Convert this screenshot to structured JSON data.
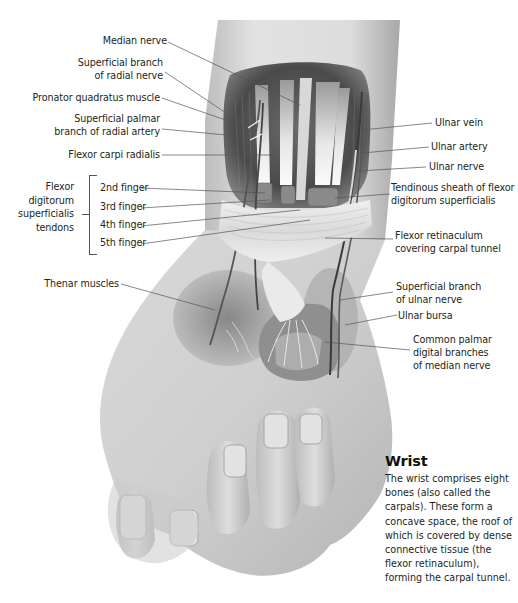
{
  "figure": {
    "palette": {
      "background": "#ffffff",
      "text": "#231f20",
      "leader_line": "#555555",
      "skin_light": "#e6e6e6",
      "skin_mid": "#c9c9c9",
      "skin_dark": "#8c8c8c",
      "muscle_dark": "#5a5a5a",
      "tendon_highlight": "#f4f4f4"
    }
  },
  "labels_left": [
    {
      "id": "median-nerve",
      "lines": [
        "Median nerve"
      ]
    },
    {
      "id": "superficial-branch-radial-nerve",
      "lines": [
        "Superficial branch",
        "of radial nerve"
      ]
    },
    {
      "id": "pronator-quadratus",
      "lines": [
        "Pronator quadratus muscle"
      ]
    },
    {
      "id": "superficial-palmar-branch-radial-artery",
      "lines": [
        "Superficial palmar",
        "branch of radial artery"
      ]
    },
    {
      "id": "flexor-carpi-radialis",
      "lines": [
        "Flexor carpi radialis"
      ]
    },
    {
      "id": "thenar-muscles",
      "lines": [
        "Thenar muscles"
      ]
    }
  ],
  "tendon_group": {
    "group_label_lines": [
      "Flexor",
      "digitorum",
      "superficialis",
      "tendons"
    ],
    "items": [
      {
        "id": "2nd-finger",
        "label": "2nd finger"
      },
      {
        "id": "3rd-finger",
        "label": "3rd finger"
      },
      {
        "id": "4th-finger",
        "label": "4th finger"
      },
      {
        "id": "5th-finger",
        "label": "5th finger"
      }
    ]
  },
  "labels_right": [
    {
      "id": "ulnar-vein",
      "lines": [
        "Ulnar vein"
      ]
    },
    {
      "id": "ulnar-artery",
      "lines": [
        "Ulnar artery"
      ]
    },
    {
      "id": "ulnar-nerve",
      "lines": [
        "Ulnar nerve"
      ]
    },
    {
      "id": "tendinous-sheath",
      "lines": [
        "Tendinous sheath of flexor",
        "digitorum superficialis"
      ]
    },
    {
      "id": "flexor-retinaculum",
      "lines": [
        "Flexor retinaculum",
        "covering carpal tunnel"
      ]
    },
    {
      "id": "superficial-branch-ulnar-nerve",
      "lines": [
        "Superficial branch",
        "of ulnar nerve"
      ]
    },
    {
      "id": "ulnar-bursa",
      "lines": [
        "Ulnar bursa"
      ]
    },
    {
      "id": "common-palmar-digital-branches",
      "lines": [
        "Common palmar",
        "digital branches",
        "of median nerve"
      ]
    }
  ],
  "info_box": {
    "title": "Wrist",
    "body": "The wrist comprises eight bones (also called the carpals). These form a concave space, the roof of which is covered by dense connective tissue (the flexor retinaculum), forming the carpal tunnel."
  }
}
